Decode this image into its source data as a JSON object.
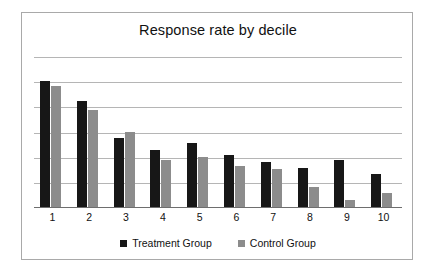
{
  "chart_data": {
    "type": "bar",
    "title": "Response rate by decile",
    "xlabel": "",
    "ylabel": "",
    "categories": [
      "1",
      "2",
      "3",
      "4",
      "5",
      "6",
      "7",
      "8",
      "9",
      "10"
    ],
    "series": [
      {
        "name": "Treatment Group",
        "color": "#171717",
        "values": [
          5.0,
          4.2,
          2.75,
          2.25,
          2.55,
          2.05,
          1.8,
          1.55,
          1.85,
          1.3
        ]
      },
      {
        "name": "Control Group",
        "color": "#8c8c8c",
        "values": [
          4.8,
          3.85,
          3.0,
          1.85,
          2.0,
          1.65,
          1.5,
          0.8,
          0.3,
          0.55
        ]
      }
    ],
    "ylim": [
      0,
      6
    ],
    "yticks": [
      0,
      1,
      2,
      3,
      4,
      5,
      6
    ],
    "grid": true,
    "legend_position": "bottom",
    "legend": [
      "Treatment Group",
      "Control Group"
    ]
  },
  "legend": {
    "treatment_label": "Treatment Group",
    "control_label": "Control Group"
  },
  "colors": {
    "treatment": "#171717",
    "control": "#8c8c8c",
    "gridline": "#b5b5b5",
    "frame": "#a9a9a9",
    "axis": "#6e6e6e",
    "background": "#ffffff"
  }
}
